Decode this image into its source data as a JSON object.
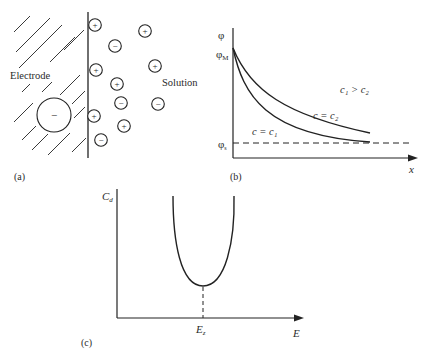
{
  "panel_a": {
    "label": "(a)",
    "electrode_label": "Electrode",
    "solution_label": "Solution",
    "electrode_charge": "−",
    "ions": [
      {
        "sign": "+",
        "x": 95,
        "y": 25
      },
      {
        "sign": "+",
        "x": 145,
        "y": 31
      },
      {
        "sign": "−",
        "x": 115,
        "y": 46
      },
      {
        "sign": "+",
        "x": 96,
        "y": 70
      },
      {
        "sign": "+",
        "x": 155,
        "y": 66
      },
      {
        "sign": "+",
        "x": 117,
        "y": 84
      },
      {
        "sign": "−",
        "x": 121,
        "y": 103
      },
      {
        "sign": "−",
        "x": 158,
        "y": 104
      },
      {
        "sign": "+",
        "x": 94,
        "y": 116
      },
      {
        "sign": "+",
        "x": 124,
        "y": 126
      },
      {
        "sign": "−",
        "x": 101,
        "y": 140
      }
    ]
  },
  "panel_b": {
    "label": "(b)",
    "y_axis_label": "φ",
    "phi_m_label": "φ",
    "phi_m_sub": "M",
    "phi_s_label": "φ",
    "phi_s_sub": "s",
    "x_axis_label": "x",
    "condition": "c₁ > c₂",
    "curve_c2_label": "c = c₂",
    "curve_c1_label": "c = c₁"
  },
  "panel_c": {
    "label": "(c)",
    "y_axis_label": "C",
    "y_axis_sub": "d",
    "x_axis_label": "E",
    "min_label": "E",
    "min_sub": "z"
  }
}
